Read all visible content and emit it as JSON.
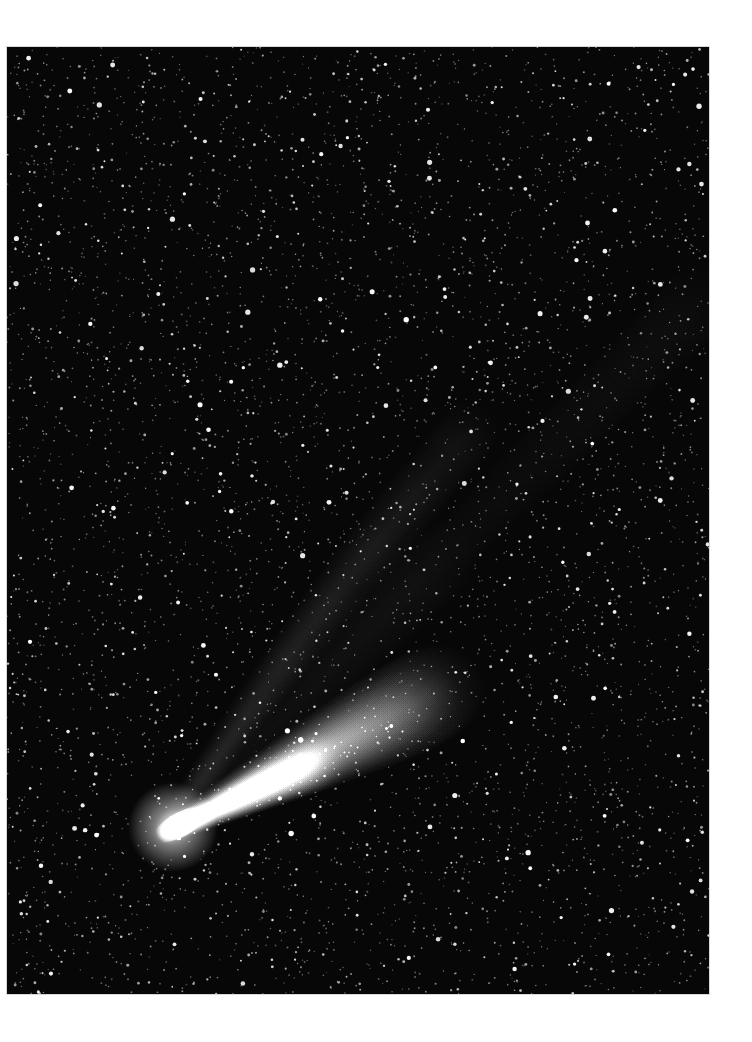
{
  "image": {
    "subject": "Comet with two tails against a dense star field",
    "background_color": "#ffffff",
    "sky_color": "#070707",
    "frame": {
      "x": 7,
      "y": 47,
      "width": 702,
      "height": 947
    },
    "comet": {
      "nucleus": {
        "x": 165,
        "y": 833
      },
      "dust_tail": {
        "direction_to": {
          "x": 440,
          "y": 690
        },
        "color": "#ffffff"
      },
      "ion_tail": {
        "direction_to": {
          "x": 700,
          "y": 300
        },
        "color": "#cfcfcf"
      }
    }
  }
}
